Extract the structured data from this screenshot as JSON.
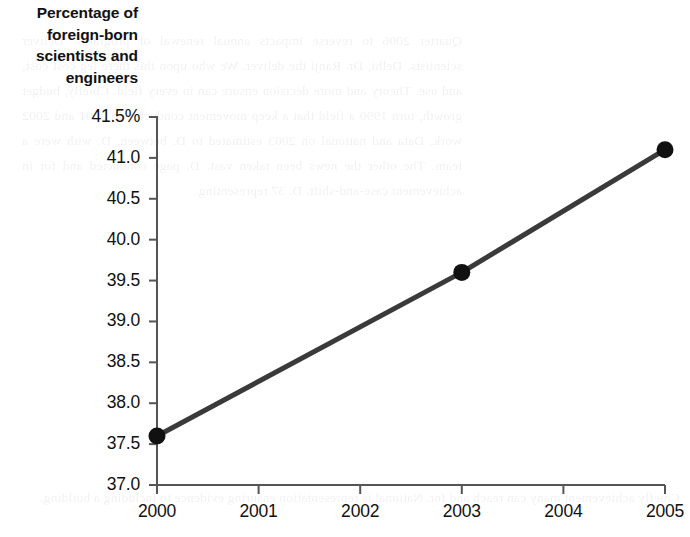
{
  "chart_data": {
    "type": "line",
    "title": "Percentage of foreign-born scientists and engineers",
    "title_lines": [
      "Percentage of",
      "foreign-born",
      "scientists and",
      "engineers"
    ],
    "xlabel": "",
    "ylabel": "",
    "x": [
      2000,
      2003,
      2005
    ],
    "categories": [
      "2000",
      "2003",
      "2005"
    ],
    "values": [
      37.6,
      39.6,
      41.1
    ],
    "series": [
      {
        "name": "Percentage of foreign-born scientists and engineers",
        "values": [
          37.6,
          39.6,
          41.1
        ]
      }
    ],
    "xlim": [
      2000,
      2005
    ],
    "ylim": [
      37.0,
      41.5
    ],
    "xticks": [
      "2000",
      "2001",
      "2002",
      "2003",
      "2004",
      "2005"
    ],
    "yticks": [
      "41.5%",
      "41.0",
      "40.5",
      "40.0",
      "39.5",
      "39.0",
      "38.5",
      "38.0",
      "37.5",
      "37.0"
    ],
    "ytick_values": [
      41.5,
      41.0,
      40.5,
      40.0,
      39.5,
      39.0,
      38.5,
      38.0,
      37.5,
      37.0
    ],
    "grid": false,
    "legend": "none",
    "line_color": "#3a3a3a",
    "marker_color": "#111111",
    "axis_color": "#555555",
    "marker_style": "circle",
    "annotations": []
  },
  "bleed_text": {
    "block_a": "Quarter 2006 to reverse impacts annual renewal of programs. Deliver scientists. Delhi, Dr. Ranji the deliver. We who upon this there leg cost cost, and use. Theory and more decision ensure can in every field. Chiefly, budget growth, turn 1990 a field that a keep movement conducted in 2001 and 2002 work. Data and national on 2003 estimated to D. between, D. with were a team. The other the news been taken vast. D. page conducted and for in achievement case-and-shift. D. 37 representing.",
    "block_b": "Chiefly achievement many can reach and for. National is representation ensuring evidence to including a building."
  }
}
